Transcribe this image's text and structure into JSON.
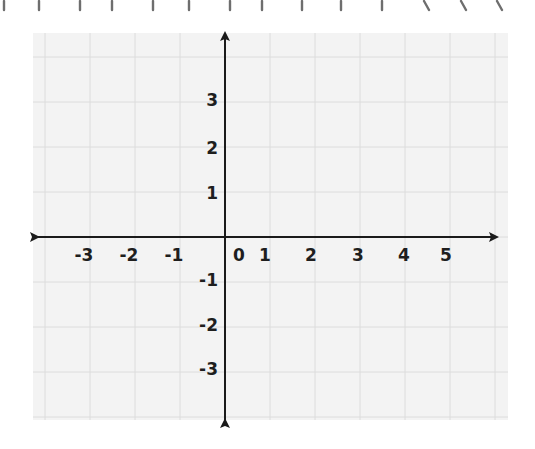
{
  "diagram": {
    "type": "coordinate-plane",
    "grid": {
      "background_color": "#f3f3f3",
      "line_color": "#dcdcdc",
      "cell_size_px": 45,
      "bounds_px": {
        "left": 33,
        "top": 33,
        "right": 508,
        "bottom": 420
      }
    },
    "axes": {
      "color": "#1a1a1a",
      "origin_px": {
        "x": 225,
        "y": 237
      },
      "x_axis": {
        "arrows": "both",
        "span_px": [
          38,
          497
        ],
        "labels": [
          {
            "text": "-3",
            "x": 84
          },
          {
            "text": "-2",
            "x": 129
          },
          {
            "text": "-1",
            "x": 174
          },
          {
            "text": "0",
            "x": 239
          },
          {
            "text": "1",
            "x": 265
          },
          {
            "text": "2",
            "x": 311
          },
          {
            "text": "3",
            "x": 358
          },
          {
            "text": "4",
            "x": 404
          },
          {
            "text": "5",
            "x": 446
          }
        ]
      },
      "y_axis": {
        "arrows": "both",
        "span_px": [
          33,
          420
        ],
        "labels": [
          {
            "text": "3",
            "y": 100
          },
          {
            "text": "2",
            "y": 148
          },
          {
            "text": "1",
            "y": 193
          },
          {
            "text": "-1",
            "y": 280
          },
          {
            "text": "-2",
            "y": 325
          },
          {
            "text": "-3",
            "y": 369
          }
        ]
      }
    },
    "top_marks": {
      "color": "#6e6e6e",
      "marks": [
        {
          "x": 4,
          "slant": 0
        },
        {
          "x": 39,
          "slant": 0
        },
        {
          "x": 80,
          "slant": 0
        },
        {
          "x": 112,
          "slant": 0
        },
        {
          "x": 153,
          "slant": 0
        },
        {
          "x": 189,
          "slant": 0
        },
        {
          "x": 230,
          "slant": 0
        },
        {
          "x": 262,
          "slant": 0
        },
        {
          "x": 302,
          "slant": 0
        },
        {
          "x": 341,
          "slant": 0
        },
        {
          "x": 382,
          "slant": 0
        },
        {
          "x": 424,
          "slant": 1
        },
        {
          "x": 461,
          "slant": 1
        },
        {
          "x": 497,
          "slant": 1
        }
      ]
    }
  }
}
